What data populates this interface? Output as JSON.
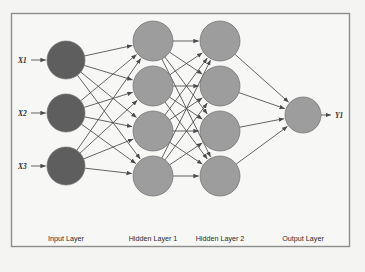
{
  "diagram": {
    "background_color": "#f4f4f3",
    "panel": {
      "border_color": "#8d8d8d",
      "fill_color": "#f7f7f6",
      "x": 11,
      "y": 13,
      "width": 339,
      "height": 234
    },
    "colors": {
      "input_node": "#5e5e5e",
      "hidden_node": "#9d9d9d",
      "output_node": "#9d9d9d",
      "node_stroke": "#6f6f6f",
      "edge": "#4a4a4a",
      "label_text": "#2e2e2e"
    },
    "inputs": [
      {
        "label": "X1",
        "cx": 66,
        "cy": 60
      },
      {
        "label": "X2",
        "cx": 66,
        "cy": 113
      },
      {
        "label": "X3",
        "cx": 66,
        "cy": 166
      }
    ],
    "hidden1": [
      {
        "cx": 153,
        "cy": 41
      },
      {
        "cx": 153,
        "cy": 86
      },
      {
        "cx": 153,
        "cy": 131
      },
      {
        "cx": 153,
        "cy": 176
      }
    ],
    "hidden2": [
      {
        "cx": 220,
        "cy": 41
      },
      {
        "cx": 220,
        "cy": 86
      },
      {
        "cx": 220,
        "cy": 131
      },
      {
        "cx": 220,
        "cy": 176
      }
    ],
    "outputs": [
      {
        "label": "Y1",
        "cx": 303,
        "cy": 115
      }
    ],
    "radii": {
      "input": 19,
      "hidden": 20,
      "output": 18
    },
    "captions": [
      {
        "text": "Input Layer",
        "x": 66,
        "y": 241
      },
      {
        "text": "Hidden Layer 1",
        "x": 153,
        "y": 241
      },
      {
        "text": "Hidden Layer 2",
        "x": 220,
        "y": 241
      },
      {
        "text": "Output Layer",
        "x": 303,
        "y": 241
      }
    ],
    "connections": {
      "input_to_hidden1": "fully-connected",
      "hidden1_to_hidden2": "fully-connected",
      "hidden2_to_output": "fully-connected"
    }
  }
}
